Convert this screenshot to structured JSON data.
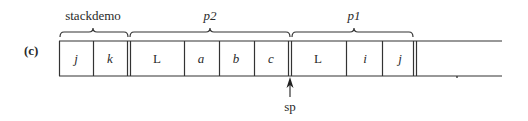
{
  "figure": {
    "part_label": "(c)",
    "groups": [
      {
        "label": "stackdemo",
        "italic": false,
        "x": 93
      },
      {
        "label": "p2",
        "italic": true,
        "x": 210
      },
      {
        "label": "p1",
        "italic": true,
        "x": 354
      }
    ],
    "cells": [
      {
        "label": "j",
        "italic": true,
        "x": 76
      },
      {
        "label": "k",
        "italic": true,
        "x": 110
      },
      {
        "label": "L",
        "italic": false,
        "x": 157
      },
      {
        "label": "a",
        "italic": true,
        "x": 201
      },
      {
        "label": "b",
        "italic": true,
        "x": 236
      },
      {
        "label": "c",
        "italic": true,
        "x": 271
      },
      {
        "label": "L",
        "italic": false,
        "x": 318
      },
      {
        "label": "i",
        "italic": true,
        "x": 365
      },
      {
        "label": "j",
        "italic": true,
        "x": 400
      }
    ],
    "pointer": {
      "label": "sp",
      "x": 290
    }
  }
}
